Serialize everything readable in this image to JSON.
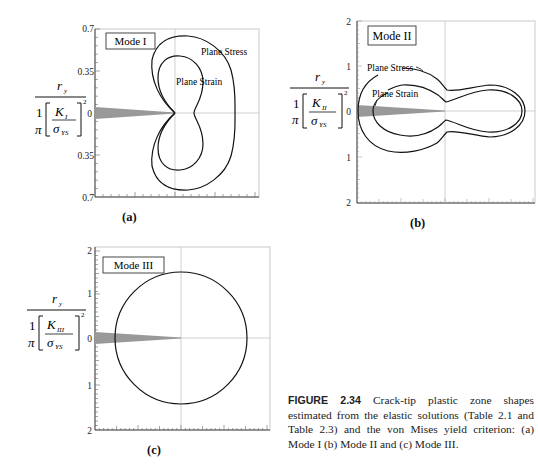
{
  "figure": {
    "number": "FIGURE 2.34",
    "caption": "Crack-tip plastic zone shapes estimated from the elastic solutions (Table 2.1 and Table 2.3) and the von Mises yield criterion: (a) Mode I (b) Mode II and (c) Mode III."
  },
  "panels": [
    {
      "id": "a",
      "sublabel": "(a)",
      "mode_label": "Mode I",
      "ylabel_num": "r_y",
      "ylabel_K": "K_I",
      "ylabel_sigma": "σ_YS",
      "yticks": [
        "0.7",
        "0.35",
        "0",
        "0.35",
        "0.7"
      ],
      "curves": [
        "Plane Stress",
        "Plane Strain"
      ]
    },
    {
      "id": "b",
      "sublabel": "(b)",
      "mode_label": "Mode II",
      "ylabel_num": "r_y",
      "ylabel_K": "K_II",
      "ylabel_sigma": "σ_YS",
      "yticks": [
        "2",
        "1",
        "0",
        "1",
        "2"
      ],
      "curves": [
        "Plane Stress",
        "Plane Strain"
      ]
    },
    {
      "id": "c",
      "sublabel": "(c)",
      "mode_label": "Mode III",
      "ylabel_num": "r_y",
      "ylabel_K": "K_III",
      "ylabel_sigma": "σ_YS",
      "yticks": [
        "2",
        "1",
        "0",
        "1",
        "2"
      ],
      "curves": []
    }
  ],
  "labels": {
    "a_sub": "(a)",
    "b_sub": "(b)",
    "c_sub": "(c)",
    "a_mode": "Mode I",
    "b_mode": "Mode II",
    "c_mode": "Mode III",
    "plane_stress": "Plane Stress",
    "plane_strain": "Plane Strain",
    "one": "1",
    "pi": "π",
    "K": "K",
    "sub_I": "I",
    "sub_II": "II",
    "sub_III": "III",
    "sigma": "σ",
    "sub_YS": "YS",
    "r": "r",
    "sub_y": "y",
    "sq": "2",
    "a_t0": "0.7",
    "a_t1": "0.35",
    "a_t2": "0",
    "a_t3": "0.35",
    "a_t4": "0.7",
    "b_t0": "2",
    "b_t1": "1",
    "b_t2": "0",
    "b_t3": "1",
    "b_t4": "2",
    "c_t0": "2",
    "c_t1": "1",
    "c_t2": "0",
    "c_t3": "1",
    "c_t4": "2"
  }
}
